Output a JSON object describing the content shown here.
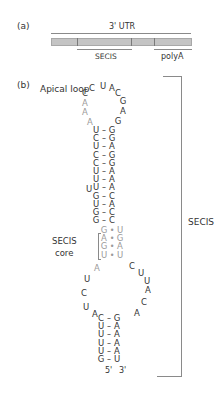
{
  "panel_a": {
    "label": "(a)",
    "utr_label": "3' UTR",
    "secis_label": "SECIS",
    "polya_label": "polyA"
  },
  "panel_b": {
    "label": "(b)",
    "apical_loop_label": "Apical loop",
    "secis_core_label_1": "SECIS",
    "secis_core_label_2": "core",
    "secis_label": "SECIS",
    "five_prime": "5'",
    "three_prime": "3'",
    "apical_loop": {
      "left_up": [
        "A",
        "A",
        "A",
        "C",
        "C"
      ],
      "top": [
        "U",
        "A"
      ],
      "right_down": [
        "C",
        "G",
        "A",
        "G"
      ]
    },
    "upper_stem": [
      {
        "l": "U",
        "r": "G"
      },
      {
        "l": "C",
        "r": "G"
      },
      {
        "l": "U",
        "r": "A"
      },
      {
        "l": "C",
        "r": "G"
      },
      {
        "l": "C",
        "r": "G"
      },
      {
        "l": "U",
        "r": "A"
      },
      {
        "l": "U",
        "r": "A"
      },
      {
        "l": "U",
        "r": "A"
      },
      {
        "l": "G",
        "r": "C"
      },
      {
        "l": "U",
        "r": "A"
      },
      {
        "l": "G",
        "r": "C"
      },
      {
        "l": "G",
        "r": "C"
      }
    ],
    "bulge": "U",
    "core": [
      {
        "l": "G",
        "r": "U"
      },
      {
        "l": "A",
        "r": "G"
      },
      {
        "l": "G",
        "r": "A"
      },
      {
        "l": "U",
        "r": "U"
      }
    ],
    "internal_loop": {
      "left_down": [
        "A",
        "U",
        "C",
        "U",
        "A"
      ],
      "right_down": [
        "C",
        "U",
        "U",
        "A",
        "C",
        "A"
      ]
    },
    "lower_stem": [
      {
        "l": "C",
        "r": "G"
      },
      {
        "l": "U",
        "r": "A"
      },
      {
        "l": "U",
        "r": "A"
      },
      {
        "l": "U",
        "r": "A"
      },
      {
        "l": "U",
        "r": "A"
      },
      {
        "l": "G",
        "r": "U"
      }
    ],
    "bond_wc": "–",
    "bond_nc": "•"
  }
}
